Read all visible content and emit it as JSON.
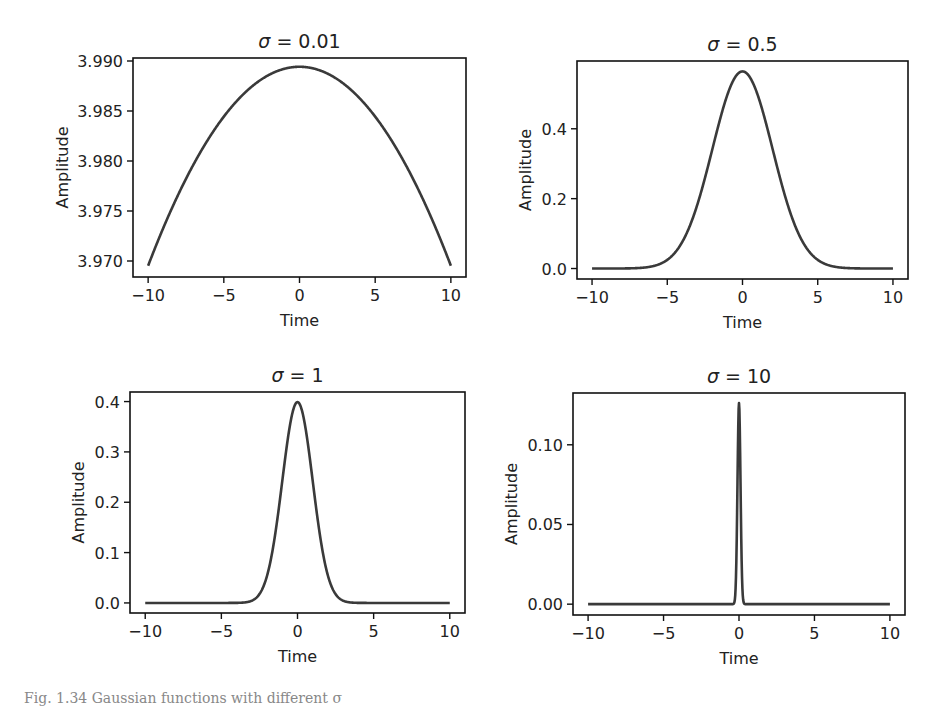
{
  "figure": {
    "caption": "Fig. 1.34 Gaussian functions with different σ",
    "line_color": "#3a3a3a",
    "axis_color": "#111111"
  },
  "chart_data": [
    {
      "type": "line",
      "title": "σ = 0.01",
      "title_sym": "σ",
      "title_val": "= 0.01",
      "sigma": 0.01,
      "xlabel": "Time",
      "ylabel": "Amplitude",
      "xlim": [
        -11,
        11
      ],
      "ylim": [
        3.9684,
        3.9903
      ],
      "xticks": [
        -10,
        -5,
        0,
        5,
        10
      ],
      "xticklabels": [
        "−10",
        "−5",
        "0",
        "5",
        "10"
      ],
      "yticks": [
        3.97,
        3.975,
        3.98,
        3.985,
        3.99
      ],
      "yticklabels": [
        "3.970",
        "3.975",
        "3.980",
        "3.985",
        "3.990"
      ],
      "x": [
        -10,
        -5,
        0,
        5,
        10
      ],
      "values": [
        3.9695,
        3.984,
        3.9894,
        3.984,
        3.9695
      ],
      "peak": 3.9894,
      "grid": false,
      "box": {
        "left": 133,
        "top": 58,
        "right": 466,
        "bottom": 277
      }
    },
    {
      "type": "line",
      "title": "σ = 0.5",
      "title_sym": "σ",
      "title_val": "= 0.5",
      "sigma": 0.5,
      "xlabel": "Time",
      "ylabel": "Amplitude",
      "xlim": [
        -11,
        11
      ],
      "ylim": [
        -0.03,
        0.594
      ],
      "xticks": [
        -10,
        -5,
        0,
        5,
        10
      ],
      "xticklabels": [
        "−10",
        "−5",
        "0",
        "5",
        "10"
      ],
      "yticks": [
        0.0,
        0.2,
        0.4
      ],
      "yticklabels": [
        "0.0",
        "0.2",
        "0.4"
      ],
      "x": [
        -10,
        -5,
        -2.5,
        0,
        2.5,
        5,
        10
      ],
      "values": [
        0.0,
        0.024,
        0.256,
        0.564,
        0.256,
        0.024,
        0.0
      ],
      "peak": 0.564,
      "grid": false,
      "box": {
        "left": 577,
        "top": 61,
        "right": 908,
        "bottom": 279
      }
    },
    {
      "type": "line",
      "title": "σ = 1",
      "title_sym": "σ",
      "title_val": "= 1",
      "sigma": 1,
      "xlabel": "Time",
      "ylabel": "Amplitude",
      "xlim": [
        -11,
        11
      ],
      "ylim": [
        -0.02,
        0.419
      ],
      "xticks": [
        -10,
        -5,
        0,
        5,
        10
      ],
      "xticklabels": [
        "−10",
        "−5",
        "0",
        "5",
        "10"
      ],
      "yticks": [
        0.0,
        0.1,
        0.2,
        0.3,
        0.4
      ],
      "yticklabels": [
        "0.0",
        "0.1",
        "0.2",
        "0.3",
        "0.4"
      ],
      "x": [
        -10,
        -5,
        -2,
        -1,
        0,
        1,
        2,
        5,
        10
      ],
      "values": [
        0.0,
        0.0,
        0.054,
        0.242,
        0.399,
        0.242,
        0.054,
        0.0,
        0.0
      ],
      "peak": 0.399,
      "grid": false,
      "box": {
        "left": 130,
        "top": 392,
        "right": 465,
        "bottom": 613
      }
    },
    {
      "type": "line",
      "title": "σ = 10",
      "title_sym": "σ",
      "title_val": "= 10",
      "sigma": 10,
      "xlabel": "Time",
      "ylabel": "Amplitude",
      "xlim": [
        -11,
        11
      ],
      "ylim": [
        -0.0068,
        0.1325
      ],
      "xticks": [
        -10,
        -5,
        0,
        5,
        10
      ],
      "xticklabels": [
        "−10",
        "−5",
        "0",
        "5",
        "10"
      ],
      "yticks": [
        0.0,
        0.05,
        0.1
      ],
      "yticklabels": [
        "0.00",
        "0.05",
        "0.10"
      ],
      "x": [
        -10,
        -0.2,
        -0.1,
        0,
        0.1,
        0.2,
        10
      ],
      "values": [
        0.0,
        0.017,
        0.077,
        0.126,
        0.077,
        0.017,
        0.0
      ],
      "peak": 0.126,
      "grid": false,
      "box": {
        "left": 573,
        "top": 393,
        "right": 905,
        "bottom": 615
      }
    }
  ]
}
